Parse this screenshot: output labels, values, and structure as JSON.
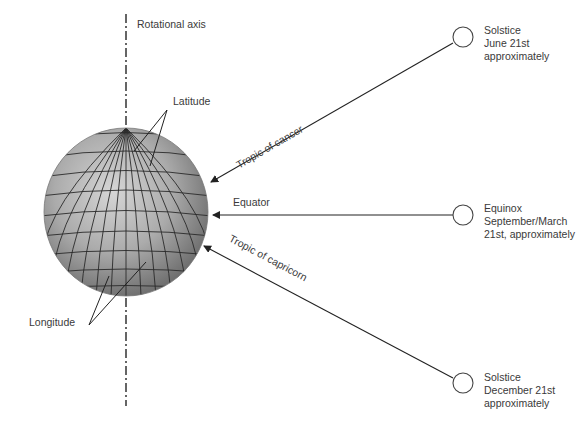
{
  "diagram": {
    "type": "earth-sun-geometry",
    "colors": {
      "line": "#222222",
      "text": "#3a3a3a",
      "globe_light": "#cfcfcf",
      "globe_mid": "#a8a8a8",
      "globe_dark": "#6a6a6a",
      "grid": "#2a2a2a",
      "circle": "#444444"
    },
    "axis": {
      "label": "Rotational axis"
    },
    "globe": {
      "latitude_label": "Latitude",
      "longitude_label": "Longitude"
    },
    "lines": {
      "tropic_cancer": "Tropic of cancer",
      "equator": "Equator",
      "tropic_capricorn": "Tropic of capricorn"
    },
    "sun_positions": [
      {
        "event": "Solstice",
        "date": "June 21st",
        "note": "approximately"
      },
      {
        "event": "Equinox",
        "date": "September/March",
        "note": "21st, approximately"
      },
      {
        "event": "Solstice",
        "date": "December 21st",
        "note": "approximately"
      }
    ]
  }
}
